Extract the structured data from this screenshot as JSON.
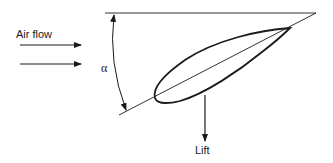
{
  "diagram": {
    "labels": {
      "air_flow": "Air flow",
      "alpha": "α",
      "lift": "Lift"
    },
    "elements": {
      "reference_line": "horizontal reference line",
      "chord_line": "chord line",
      "airfoil": "airfoil cross-section",
      "angle_arc": "angle of attack arc",
      "airflow_arrows": 2,
      "lift_arrow": "downward arrow"
    },
    "colors": {
      "stroke": "#1a1a1a",
      "background": "#ffffff"
    }
  }
}
